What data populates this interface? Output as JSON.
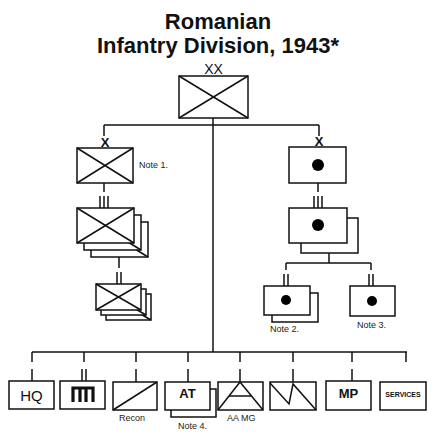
{
  "title": {
    "line1": "Romanian",
    "line2": "Infantry Division, 1943*"
  },
  "division": {
    "rank_mark": "XX",
    "symbol": "infantry"
  },
  "left_branch": {
    "brigade": {
      "rank_mark": "X",
      "symbol": "infantry",
      "note": "Note 1."
    },
    "regiment": {
      "rank_mark": "III",
      "symbol": "infantry",
      "count": 3
    },
    "battalion": {
      "rank_mark": "II",
      "symbol": "infantry",
      "count": 3
    }
  },
  "right_branch": {
    "brigade": {
      "rank_mark": "X",
      "symbol": "artillery"
    },
    "regiment": {
      "rank_mark": "III",
      "symbol": "artillery",
      "count": 2
    },
    "battalions": [
      {
        "rank_mark": "II",
        "symbol": "artillery",
        "count": 2,
        "note": "Note 2."
      },
      {
        "rank_mark": "II",
        "symbol": "artillery",
        "count": 1,
        "note": "Note 3."
      }
    ]
  },
  "support_units": [
    {
      "id": "hq",
      "text": "HQ",
      "note": "",
      "rank_mark": "I"
    },
    {
      "id": "signal",
      "text": "",
      "note": "",
      "rank_mark": "II",
      "symbol": "signal"
    },
    {
      "id": "recon",
      "text": "",
      "note": "Recon",
      "rank_mark": "I",
      "symbol": "cavalry"
    },
    {
      "id": "at",
      "text": "AT",
      "note": "Note 4.",
      "rank_mark": "I"
    },
    {
      "id": "aa-mg",
      "text": "",
      "note": "AA MG",
      "rank_mark": "I",
      "symbol": "anti-aircraft"
    },
    {
      "id": "signal-engineer",
      "text": "",
      "note": "",
      "rank_mark": "I",
      "symbol": "lightning"
    },
    {
      "id": "mp",
      "text": "MP",
      "note": "",
      "rank_mark": "I"
    },
    {
      "id": "services",
      "text": "SERVICES",
      "note": "",
      "rank_mark": ""
    }
  ]
}
